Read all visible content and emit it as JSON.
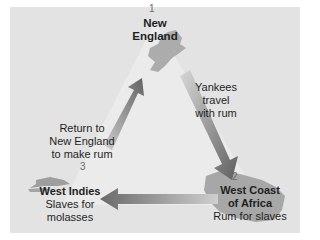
{
  "diagram": {
    "nodes": [
      {
        "number": "1",
        "name_line1": "New",
        "name_line2": "England",
        "desc": ""
      },
      {
        "number": "2",
        "name_line1": "West Coast",
        "name_line2": "of Africa",
        "desc": "Rum for slaves"
      },
      {
        "number": "3",
        "name_line1": "West Indies",
        "name_line2": "",
        "desc_line1": "Slaves for",
        "desc_line2": "molasses"
      }
    ],
    "edges": [
      {
        "from": "New England",
        "to": "West Coast of Africa",
        "label_lines": [
          "Yankees",
          "travel",
          "with rum"
        ]
      },
      {
        "from": "West Coast of Africa",
        "to": "West Indies",
        "label_lines": []
      },
      {
        "from": "West Indies",
        "to": "New England",
        "label_lines": [
          "Return to",
          "New England",
          "to make rum"
        ]
      }
    ],
    "colors": {
      "panel": "#e3e3e3",
      "land": "#a9a9a9",
      "arrow_dark": "#666666",
      "arrow_light": "#bdbdbd",
      "triangle": "#ececec"
    }
  }
}
